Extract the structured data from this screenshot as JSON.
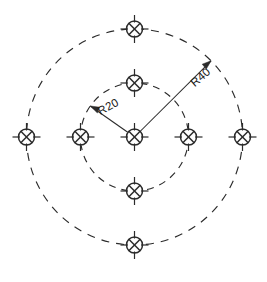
{
  "drawing": {
    "type": "engineering-bolt-circle-pattern",
    "title": "",
    "background_color": "#ffffff",
    "line_color": "#2b2b2b",
    "text_color": "#1a1a1a",
    "canvas": {
      "width": 267,
      "height": 282
    },
    "center": {
      "x": 134.5,
      "y": 137
    },
    "circles": [
      {
        "name": "inner-bolt-circle",
        "radius_px": 54,
        "radius_label": "R20",
        "style": "dashed",
        "dash_pattern": "7 6"
      },
      {
        "name": "outer-bolt-circle",
        "radius_px": 108,
        "radius_label": "R40",
        "style": "dashed",
        "dash_pattern": "8 7"
      }
    ],
    "dimensions": [
      {
        "name": "inner-radius-dimension",
        "label": "R20",
        "value": 20,
        "circle": "inner-bolt-circle",
        "leader_angle_deg": 145,
        "text_rotation_deg": -28,
        "text_x": 110,
        "text_y": 110
      },
      {
        "name": "outer-radius-dimension",
        "label": "R40",
        "value": 40,
        "circle": "outer-bolt-circle",
        "leader_angle_deg": 45,
        "text_rotation_deg": -41,
        "text_x": 203,
        "text_y": 80
      }
    ],
    "symbols": {
      "glyph_name": "crossed-circle-hole-symbol",
      "description": "circle with diagonal X and four centerline ticks",
      "circle_radius_px": 8,
      "tick_length_px": 14
    },
    "hole_positions": [
      {
        "name": "hole-center",
        "ring": "center",
        "x": 134.5,
        "y": 137,
        "angle_deg": null
      },
      {
        "name": "hole-inner-top",
        "ring": "inner",
        "x": 134.5,
        "y": 83,
        "angle_deg": 90
      },
      {
        "name": "hole-inner-right",
        "ring": "inner",
        "x": 188.5,
        "y": 137,
        "angle_deg": 0
      },
      {
        "name": "hole-inner-bottom",
        "ring": "inner",
        "x": 134.5,
        "y": 191,
        "angle_deg": 270
      },
      {
        "name": "hole-inner-left",
        "ring": "inner",
        "x": 80.5,
        "y": 137,
        "angle_deg": 180
      },
      {
        "name": "hole-outer-top",
        "ring": "outer",
        "x": 134.5,
        "y": 29,
        "angle_deg": 90
      },
      {
        "name": "hole-outer-right",
        "ring": "outer",
        "x": 242.5,
        "y": 137,
        "angle_deg": 0
      },
      {
        "name": "hole-outer-bottom",
        "ring": "outer",
        "x": 134.5,
        "y": 245,
        "angle_deg": 270
      },
      {
        "name": "hole-outer-left",
        "ring": "outer",
        "x": 26.5,
        "y": 137,
        "angle_deg": 180
      }
    ]
  }
}
